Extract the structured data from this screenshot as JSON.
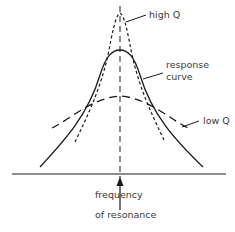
{
  "diagram": {
    "type": "resonance-response-curves",
    "labels": {
      "high_q": "high Q",
      "response_curve_line1": "response",
      "response_curve_line2": "curve",
      "low_q": "low Q",
      "frequency_line1": "frequency",
      "frequency_line2": "of resonance"
    },
    "curves": [
      {
        "name": "high Q",
        "style": "short-dashed",
        "peak": "tallest, narrowest"
      },
      {
        "name": "response curve",
        "style": "solid",
        "peak": "medium height, medium width"
      },
      {
        "name": "low Q",
        "style": "long-dashed",
        "peak": "lowest, broadest"
      }
    ],
    "center_line": {
      "style": "dashed",
      "meaning": "frequency of resonance"
    },
    "colors": {
      "ink": "#1a1a1a",
      "text": "#3a3a3a",
      "background": "#ffffff"
    }
  }
}
